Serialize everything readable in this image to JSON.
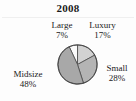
{
  "figure": {
    "title": "2008",
    "background_color": "#fdfdfd",
    "text_color": "#1a1a1a"
  },
  "chart_data": {
    "type": "pie",
    "title": "2008",
    "subtitle": "",
    "xlabel": "",
    "ylabel": "",
    "categories": [
      "Large",
      "Luxury",
      "Small",
      "Midsize"
    ],
    "values": [
      7,
      17,
      28,
      48
    ],
    "value_unit": "%",
    "value_labels": [
      "7%",
      "17%",
      "28%",
      "48%"
    ],
    "legend": "none",
    "grid": false,
    "start_angle_deg": -25,
    "direction": "clockwise",
    "slices": [
      {
        "label": "Large",
        "value": 7,
        "value_label": "7%",
        "color": "#fbfbfb",
        "stroke": "#4a4a4a",
        "start_deg": -25,
        "end_deg": 0.2,
        "label_position": "top-left"
      },
      {
        "label": "Luxury",
        "value": 17,
        "value_label": "17%",
        "color": "#d2d2d2",
        "stroke": "#4a4a4a",
        "start_deg": 0.2,
        "end_deg": 61.4,
        "label_position": "top-right"
      },
      {
        "label": "Small",
        "value": 28,
        "value_label": "28%",
        "color": "#b4b4b4",
        "stroke": "#4a4a4a",
        "start_deg": 61.4,
        "end_deg": 162.2,
        "label_position": "right"
      },
      {
        "label": "Midsize",
        "value": 48,
        "value_label": "48%",
        "color": "#a8a8a8",
        "stroke": "#4a4a4a",
        "start_deg": 162.2,
        "end_deg": 335,
        "label_position": "left"
      }
    ]
  },
  "labels": {
    "large": {
      "name": "Large",
      "pct": "7%"
    },
    "luxury": {
      "name": "Luxury",
      "pct": "17%"
    },
    "small": {
      "name": "Small",
      "pct": "28%"
    },
    "midsize": {
      "name": "Midsize",
      "pct": "48%"
    }
  }
}
